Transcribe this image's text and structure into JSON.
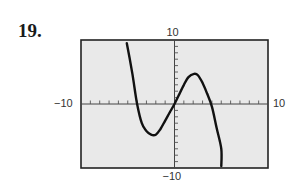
{
  "problem": {
    "number": "19."
  },
  "chart_data": {
    "type": "line",
    "title": "",
    "xlabel": "",
    "ylabel": "",
    "xlim": [
      -10,
      10
    ],
    "ylim": [
      -10,
      10
    ],
    "x_tick_labels": {
      "min": "−10",
      "max": "10"
    },
    "y_tick_labels": {
      "min": "−10",
      "max": "10"
    },
    "x_tick_step": 1,
    "y_tick_step": 1,
    "grid": false,
    "legend": null,
    "series": [
      {
        "name": "f(x)",
        "points": [
          [
            -5.1,
            9.5
          ],
          [
            -4.5,
            4.7
          ],
          [
            -4.0,
            0.0
          ],
          [
            -3.5,
            -3.0
          ],
          [
            -3.0,
            -4.2
          ],
          [
            -2.5,
            -4.8
          ],
          [
            -2.0,
            -4.8
          ],
          [
            -1.5,
            -3.9
          ],
          [
            -1.0,
            -2.6
          ],
          [
            -0.5,
            -1.3
          ],
          [
            0.0,
            0.0
          ],
          [
            0.5,
            1.5
          ],
          [
            1.0,
            3.0
          ],
          [
            1.5,
            4.2
          ],
          [
            2.1,
            4.7
          ],
          [
            2.5,
            4.5
          ],
          [
            3.0,
            3.3
          ],
          [
            3.5,
            1.6
          ],
          [
            4.0,
            -0.4
          ],
          [
            4.5,
            -3.7
          ],
          [
            5.0,
            -7.0
          ],
          [
            5.0,
            -9.7
          ]
        ]
      }
    ],
    "colors": {
      "curve": "#111111",
      "frame": "#222222",
      "background": "#e9e9e9"
    }
  }
}
